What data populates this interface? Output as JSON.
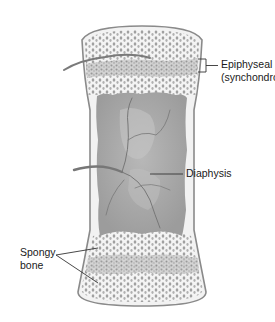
{
  "figure": {
    "colors": {
      "bone_outline": "#8a8a8a",
      "bone_fill": "#f2f2f2",
      "medulla": "#a8a8a8",
      "spongy_dots": "#9a9a9a",
      "vessel": "#7a7a7a",
      "label_text": "#1a1a1a",
      "leader_line": "#333333"
    }
  },
  "labels": {
    "epiphyseal_plate_line1": "Epiphyseal plate",
    "epiphyseal_plate_line2": "(synchondrosis)",
    "diaphysis": "Diaphysis",
    "spongy_bone_line1": "Spongy",
    "spongy_bone_line2": "bone"
  }
}
